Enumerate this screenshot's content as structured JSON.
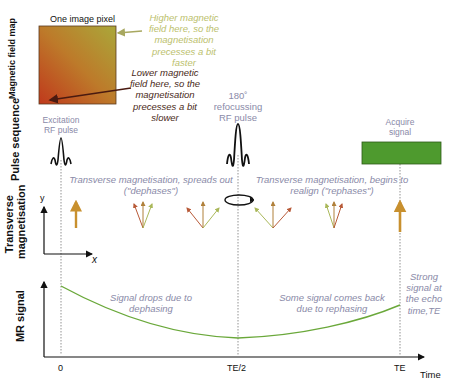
{
  "field_map": {
    "pixel_label": "One image pixel",
    "axis_label": "Magnetic field map",
    "higher_note": [
      "Higher magnetic",
      "field here, so the",
      "magnetisation",
      "precesses a bit",
      "faster"
    ],
    "lower_note": [
      "Lower magnetic",
      "field here, so the",
      "magnetisation",
      "precesses a bit",
      "slower"
    ],
    "colors": {
      "top_right": "#b5a02e",
      "bottom_left": "#c0451e"
    }
  },
  "pulse_sequence": {
    "row_label": "Pulse sequence",
    "excitation_label": [
      "Excitation",
      "RF pulse"
    ],
    "refocus_label": [
      "180˚",
      "refocussing",
      "RF pulse"
    ],
    "acquire_label": [
      "Acquire",
      "signal"
    ],
    "acquire_color": "#4e9a2e"
  },
  "transverse": {
    "row_label": [
      "Transverse",
      "magnetisation"
    ],
    "axis_y": "y",
    "axis_x": "x",
    "dephase_note": [
      "Transverse magnetisation, spreads out",
      "(\"dephases\")"
    ],
    "rephase_note": [
      "Transverse magnetisation, begins to",
      "realign (\"rephases\")"
    ]
  },
  "mr_signal": {
    "row_label": "MR signal",
    "drop_note": [
      "Signal drops due to",
      "dephasing"
    ],
    "back_note": [
      "Some signal comes back",
      "due to rephasing"
    ],
    "strong_note": [
      "Strong",
      "signal at",
      "the echo",
      "time,TE"
    ],
    "curve_color": "#6aa83a"
  },
  "time_axis": {
    "ticks": [
      "0",
      "TE/2",
      "TE"
    ],
    "label": "Time"
  }
}
